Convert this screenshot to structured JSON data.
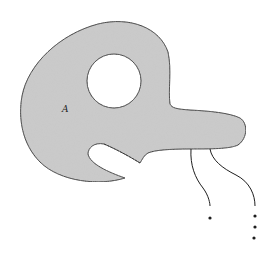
{
  "diagram": {
    "region_label": "A",
    "colors": {
      "fill": "#c9c9c9",
      "stroke": "#1e1e1e",
      "background": "#ffffff"
    },
    "elements": [
      {
        "type": "shaded-region",
        "label": "A",
        "description": "disk-like region with a circular hole, a protruding arm to the right and a notch cut at bottom-left"
      },
      {
        "type": "hole",
        "shape": "circle"
      },
      {
        "type": "curve",
        "count": 2,
        "description": "two wavy strands descending from the arm"
      },
      {
        "type": "dots",
        "count": 4,
        "description": "ellipsis dots below strands"
      }
    ]
  }
}
